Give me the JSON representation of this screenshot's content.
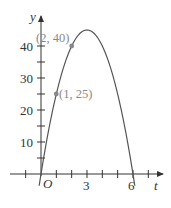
{
  "chart_data": {
    "type": "line",
    "title": "",
    "xlabel": "t",
    "ylabel": "y",
    "function": "y = 30t - 5t^2",
    "xlim": [
      -1.5,
      7.5
    ],
    "ylim": [
      -5,
      47
    ],
    "x_ticks": [
      -1,
      0,
      1,
      2,
      3,
      4,
      5,
      6,
      7
    ],
    "x_tick_labels": [
      "O",
      "3",
      "6"
    ],
    "y_ticks": [
      5,
      10,
      15,
      20,
      25,
      30,
      35,
      40
    ],
    "y_tick_labels": [
      "10",
      "20",
      "30",
      "40"
    ],
    "grid": false,
    "series": [
      {
        "name": "curve",
        "x": [
          -0.1,
          0,
          0.5,
          1,
          1.5,
          2,
          2.5,
          3,
          3.5,
          4,
          4.5,
          5,
          5.5,
          6,
          6.1
        ],
        "values": [
          -3.05,
          0,
          13.75,
          25,
          33.75,
          40,
          43.75,
          45,
          43.75,
          40,
          33.75,
          25,
          13.75,
          0,
          -3.05
        ]
      }
    ],
    "highlighted_points": [
      {
        "x": 1,
        "y": 25,
        "label": "(1, 25)"
      },
      {
        "x": 2,
        "y": 40,
        "label": "(2, 40)"
      }
    ],
    "colors": {
      "curve": "#555555",
      "axis": "#333333",
      "point": "#888888",
      "point_label": "#888888"
    }
  },
  "labels": {
    "origin": "O",
    "x3": "3",
    "x6": "6",
    "y10": "10",
    "y20": "20",
    "y30": "30",
    "y40": "40",
    "x_axis": "t",
    "y_axis": "y",
    "p1": "(1, 25)",
    "p2": "(2, 40)"
  }
}
